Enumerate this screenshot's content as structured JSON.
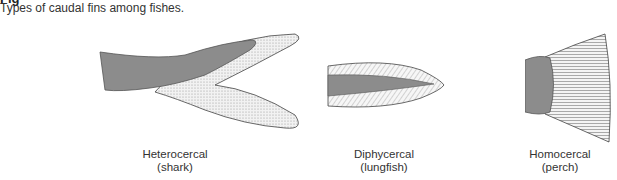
{
  "figure": {
    "title_partial": "Fig",
    "caption": "Types of caudal fins among fishes."
  },
  "fins": [
    {
      "name": "Heterocercal",
      "example": "(shark)"
    },
    {
      "name": "Diphycercal",
      "example": "(lungfish)"
    },
    {
      "name": "Homocercal",
      "example": "(perch)"
    }
  ],
  "colors": {
    "body": "#8c8c8c",
    "fin_fill": "#ececec",
    "outline": "#444444"
  }
}
